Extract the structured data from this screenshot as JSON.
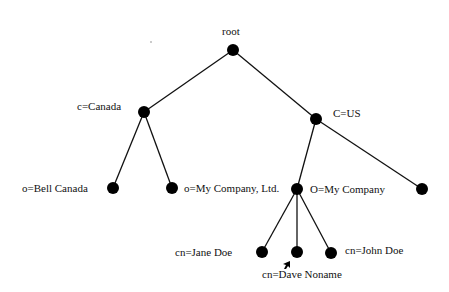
{
  "diagram": {
    "type": "tree",
    "title": "",
    "nodes": [
      {
        "id": "root",
        "label": "root",
        "x": 233,
        "y": 50,
        "label_x": 222,
        "label_y": 25
      },
      {
        "id": "canada",
        "label": "c=Canada",
        "x": 144,
        "y": 112,
        "label_x": 77,
        "label_y": 100
      },
      {
        "id": "us",
        "label": "C=US",
        "x": 316,
        "y": 119,
        "label_x": 333,
        "label_y": 107
      },
      {
        "id": "bell",
        "label": "o=Bell Canada",
        "x": 113,
        "y": 188,
        "label_x": 22,
        "label_y": 182
      },
      {
        "id": "mycoltd",
        "label": "o=My Company, Ltd.",
        "x": 172,
        "y": 188,
        "label_x": 184,
        "label_y": 182
      },
      {
        "id": "myco",
        "label": "O=My Company",
        "x": 297,
        "y": 189,
        "label_x": 310,
        "label_y": 183
      },
      {
        "id": "us_other",
        "label": "",
        "x": 422,
        "y": 189,
        "label_x": 0,
        "label_y": 0
      },
      {
        "id": "jane",
        "label": "cn=Jane Doe",
        "x": 262,
        "y": 252,
        "label_x": 175,
        "label_y": 246
      },
      {
        "id": "dave",
        "label": "cn=Dave Noname",
        "x": 297,
        "y": 252,
        "label_x": 262,
        "label_y": 268
      },
      {
        "id": "john",
        "label": "cn=John Doe",
        "x": 331,
        "y": 253,
        "label_x": 345,
        "label_y": 244
      }
    ],
    "edges": [
      [
        "root",
        "canada"
      ],
      [
        "root",
        "us"
      ],
      [
        "canada",
        "bell"
      ],
      [
        "canada",
        "mycoltd"
      ],
      [
        "us",
        "myco"
      ],
      [
        "us",
        "us_other"
      ],
      [
        "myco",
        "jane"
      ],
      [
        "myco",
        "dave"
      ],
      [
        "myco",
        "john"
      ]
    ],
    "node_radius": 6,
    "colors": {
      "node": "#000000",
      "edge": "#111111",
      "text": "#111111",
      "background": "#ffffff"
    }
  },
  "labels": {
    "root": "root",
    "canada": "c=Canada",
    "us": "C=US",
    "bell": "o=Bell Canada",
    "mycoltd": "o=My Company, Ltd.",
    "myco": "O=My Company",
    "jane": "cn=Jane Doe",
    "dave": "cn=Dave Noname",
    "john": "cn=John Doe"
  },
  "cursor": {
    "icon": "mouse-pointer-icon",
    "x": 284,
    "y": 261
  }
}
